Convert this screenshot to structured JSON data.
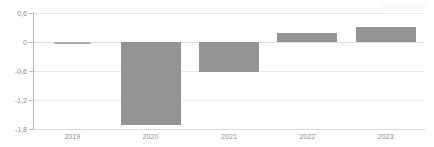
{
  "chart_data": {
    "type": "bar",
    "title": "",
    "subtitle": "",
    "xlabel": "",
    "ylabel": "",
    "categories": [
      "2019",
      "2020",
      "2021",
      "2022",
      "2023"
    ],
    "values": [
      0.0,
      -1.72,
      -0.63,
      0.18,
      0.32
    ],
    "series": [
      {
        "name": "",
        "values": [
          0.0,
          -1.72,
          -0.63,
          0.18,
          0.32
        ]
      }
    ],
    "ylim": [
      -1.8,
      0.6
    ],
    "yticks": [
      0.6,
      0,
      -0.6,
      -1.2,
      -1.8
    ],
    "ytick_labels": [
      "0,6",
      "0",
      "-0,6",
      "-1,2",
      "-1,8"
    ],
    "xtick_labels": [
      "2019",
      "2020",
      "2021",
      "2022",
      "2023"
    ],
    "grid": true,
    "grid_axis": "y",
    "legend": false,
    "legend_position": "none",
    "annotations": [],
    "bar_color": "#949494",
    "grid_color": "#e9e9e9",
    "axis_color": "#b9b9b9",
    "tick_label_color": "#8c8c8c",
    "background_color": "#ffffff"
  }
}
